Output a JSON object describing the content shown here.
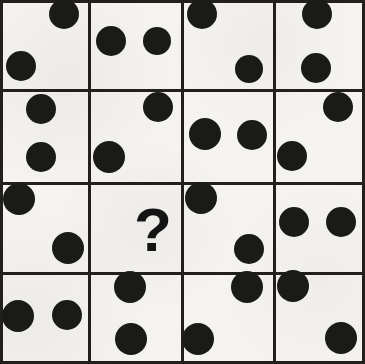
{
  "puzzle": {
    "title": "Dot Pattern Matrix Puzzle",
    "type": "matrix-reasoning",
    "rows": 4,
    "columns": 4,
    "missing_cell_symbol": "?",
    "missing_cell_row": 3,
    "missing_cell_column": 2,
    "dot_color": "#1a1a19",
    "grid_line_color": "#231f1e",
    "background_color": "#f3f2ef",
    "canvas": {
      "width": 365,
      "height": 364
    },
    "grid": {
      "x_edges": [
        0,
        88,
        181,
        273,
        365
      ],
      "y_edges": [
        0,
        89,
        182,
        272,
        364
      ],
      "line_thickness": 3
    },
    "cells": [
      {
        "id": "cell-r1c1",
        "row": 1,
        "column": 1,
        "label": "Row 1, Column 1",
        "dot_count": 2,
        "pattern": "top-right and bottom-left",
        "dots": [
          {
            "cx": 64,
            "cy": 14,
            "r": 15
          },
          {
            "cx": 21,
            "cy": 66,
            "r": 15
          }
        ]
      },
      {
        "id": "cell-r1c2",
        "row": 1,
        "column": 2,
        "label": "Row 1, Column 2",
        "dot_count": 2,
        "pattern": "two side by side, middle",
        "dots": [
          {
            "cx": 111,
            "cy": 41,
            "r": 15
          },
          {
            "cx": 157,
            "cy": 41,
            "r": 14
          }
        ]
      },
      {
        "id": "cell-r1c3",
        "row": 1,
        "column": 3,
        "label": "Row 1, Column 3",
        "dot_count": 2,
        "pattern": "top-left and bottom-right",
        "dots": [
          {
            "cx": 202,
            "cy": 14,
            "r": 15
          },
          {
            "cx": 249,
            "cy": 69,
            "r": 14
          }
        ]
      },
      {
        "id": "cell-r1c4",
        "row": 1,
        "column": 4,
        "label": "Row 1, Column 4",
        "dot_count": 2,
        "pattern": "two stacked vertically, centered",
        "dots": [
          {
            "cx": 317,
            "cy": 14,
            "r": 15
          },
          {
            "cx": 316,
            "cy": 68,
            "r": 15
          }
        ]
      },
      {
        "id": "cell-r2c1",
        "row": 2,
        "column": 1,
        "label": "Row 2, Column 1",
        "dot_count": 2,
        "pattern": "two stacked vertically, centered",
        "dots": [
          {
            "cx": 41,
            "cy": 109,
            "r": 15
          },
          {
            "cx": 41,
            "cy": 157,
            "r": 15
          }
        ]
      },
      {
        "id": "cell-r2c2",
        "row": 2,
        "column": 2,
        "label": "Row 2, Column 2",
        "dot_count": 2,
        "pattern": "top-right and bottom-left",
        "dots": [
          {
            "cx": 158,
            "cy": 107,
            "r": 15
          },
          {
            "cx": 109,
            "cy": 157,
            "r": 16
          }
        ]
      },
      {
        "id": "cell-r2c3",
        "row": 2,
        "column": 3,
        "label": "Row 2, Column 3",
        "dot_count": 2,
        "pattern": "two side by side, middle",
        "dots": [
          {
            "cx": 205,
            "cy": 134,
            "r": 16
          },
          {
            "cx": 252,
            "cy": 135,
            "r": 15
          }
        ]
      },
      {
        "id": "cell-r2c4",
        "row": 2,
        "column": 4,
        "label": "Row 2, Column 4",
        "dot_count": 2,
        "pattern": "top-right and bottom-left",
        "dots": [
          {
            "cx": 338,
            "cy": 107,
            "r": 15
          },
          {
            "cx": 292,
            "cy": 156,
            "r": 15
          }
        ]
      },
      {
        "id": "cell-r3c1",
        "row": 3,
        "column": 1,
        "label": "Row 3, Column 1",
        "dot_count": 2,
        "pattern": "top-left and bottom-right",
        "dots": [
          {
            "cx": 19,
            "cy": 199,
            "r": 16
          },
          {
            "cx": 68,
            "cy": 248,
            "r": 16
          }
        ]
      },
      {
        "id": "cell-r3c2",
        "row": 3,
        "column": 2,
        "label": "Row 3, Column 2 (missing answer)",
        "dot_count": 0,
        "pattern": "question mark placeholder",
        "is_missing": true,
        "dots": []
      },
      {
        "id": "cell-r3c3",
        "row": 3,
        "column": 3,
        "label": "Row 3, Column 3",
        "dot_count": 2,
        "pattern": "top-left and bottom-right",
        "dots": [
          {
            "cx": 201,
            "cy": 198,
            "r": 16
          },
          {
            "cx": 249,
            "cy": 249,
            "r": 15
          }
        ]
      },
      {
        "id": "cell-r3c4",
        "row": 3,
        "column": 4,
        "label": "Row 3, Column 4",
        "dot_count": 2,
        "pattern": "two side by side, middle",
        "dots": [
          {
            "cx": 294,
            "cy": 222,
            "r": 15
          },
          {
            "cx": 341,
            "cy": 222,
            "r": 15
          }
        ]
      },
      {
        "id": "cell-r4c1",
        "row": 4,
        "column": 1,
        "label": "Row 4, Column 1",
        "dot_count": 2,
        "pattern": "two side by side, middle",
        "dots": [
          {
            "cx": 18,
            "cy": 316,
            "r": 16
          },
          {
            "cx": 67,
            "cy": 315,
            "r": 15
          }
        ]
      },
      {
        "id": "cell-r4c2",
        "row": 4,
        "column": 2,
        "label": "Row 4, Column 2",
        "dot_count": 2,
        "pattern": "top-right and bottom-left",
        "dots": [
          {
            "cx": 247,
            "cy": 287,
            "r": 16
          },
          {
            "cx": 198,
            "cy": 339,
            "r": 16
          }
        ]
      },
      {
        "id": "cell-r4c3",
        "row": 4,
        "column": 3,
        "label": "Row 4, Column 3",
        "dot_count": 2,
        "pattern": "two stacked vertically, centered",
        "dots": [
          {
            "cx": 130,
            "cy": 287,
            "r": 16
          },
          {
            "cx": 131,
            "cy": 339,
            "r": 16
          }
        ]
      },
      {
        "id": "cell-r4c4",
        "row": 4,
        "column": 4,
        "label": "Row 4, Column 4",
        "dot_count": 2,
        "pattern": "top-left and bottom-right",
        "dots": [
          {
            "cx": 293,
            "cy": 286,
            "r": 16
          },
          {
            "cx": 341,
            "cy": 338,
            "r": 16
          }
        ]
      }
    ],
    "question_mark": {
      "text": "?",
      "x": 134,
      "y": 199,
      "font_size": 62
    }
  }
}
